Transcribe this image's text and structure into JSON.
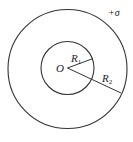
{
  "diagram": {
    "labels": {
      "center": "O",
      "inner_radius": "R",
      "inner_radius_sub": "1",
      "outer_radius": "R",
      "outer_radius_sub": "2",
      "charge_density": "+σ"
    },
    "colors": {
      "stroke": "#333333",
      "background": "#ffffff"
    }
  }
}
